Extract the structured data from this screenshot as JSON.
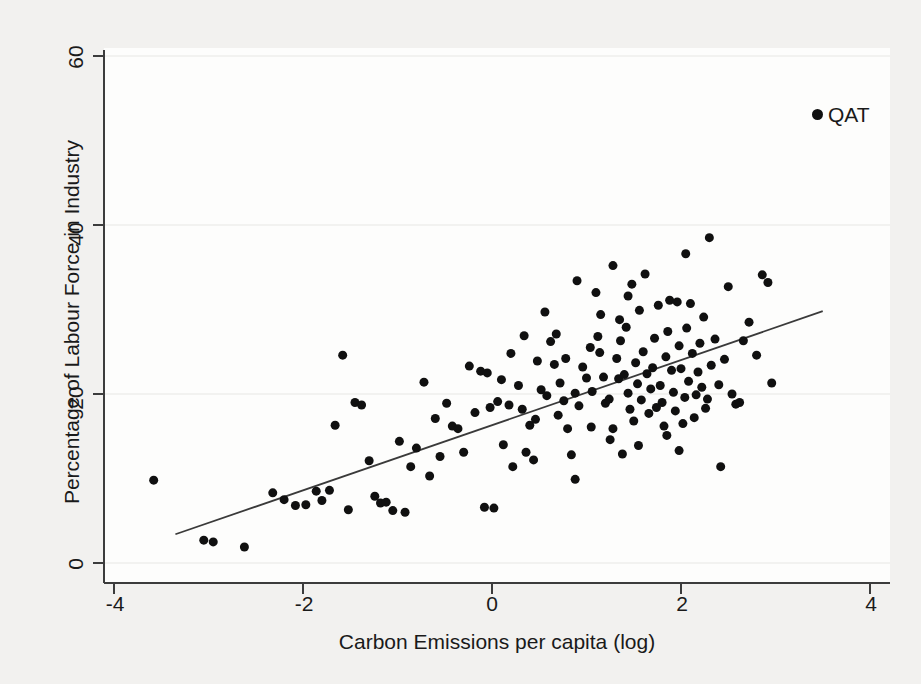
{
  "chart_data": {
    "type": "scatter",
    "title": "",
    "xlabel": "Carbon Emissions per capita (log)",
    "ylabel": "Percentage of Labour Force in Industry",
    "xlim": [
      -4.4,
      4.4
    ],
    "ylim": [
      -1.5,
      62
    ],
    "xticks": [
      -4,
      -2,
      0,
      2,
      4
    ],
    "xticklabels": [
      "-4",
      "-2",
      "0",
      "2",
      "4"
    ],
    "yticks": [
      0,
      20,
      40,
      60
    ],
    "yticklabels": [
      "0",
      "20",
      "40",
      "60"
    ],
    "grid": "faint horizontal gridlines at y ticks",
    "legend": {
      "position": "top-right",
      "entries": [
        {
          "label": "QAT",
          "marker": "filled-circle",
          "color": "#101010"
        }
      ]
    },
    "marker": {
      "shape": "circle",
      "color": "#101010",
      "size": 9
    },
    "series": [
      {
        "name": "countries",
        "points": [
          [
            -3.58,
            9.8
          ],
          [
            -3.05,
            2.7
          ],
          [
            -2.95,
            2.5
          ],
          [
            -2.62,
            1.9
          ],
          [
            -2.32,
            8.3
          ],
          [
            -2.2,
            7.5
          ],
          [
            -2.08,
            6.8
          ],
          [
            -1.97,
            6.9
          ],
          [
            -1.86,
            8.5
          ],
          [
            -1.8,
            7.4
          ],
          [
            -1.72,
            8.6
          ],
          [
            -1.66,
            16.3
          ],
          [
            -1.58,
            24.6
          ],
          [
            -1.52,
            6.3
          ],
          [
            -1.45,
            19.0
          ],
          [
            -1.38,
            18.7
          ],
          [
            -1.3,
            12.1
          ],
          [
            -1.24,
            7.9
          ],
          [
            -1.18,
            7.1
          ],
          [
            -1.12,
            7.2
          ],
          [
            -1.05,
            6.2
          ],
          [
            -0.98,
            14.4
          ],
          [
            -0.92,
            6.0
          ],
          [
            -0.86,
            11.4
          ],
          [
            -0.8,
            13.6
          ],
          [
            -0.72,
            21.4
          ],
          [
            -0.66,
            10.3
          ],
          [
            -0.6,
            17.1
          ],
          [
            -0.55,
            12.6
          ],
          [
            -0.48,
            18.9
          ],
          [
            -0.42,
            16.2
          ],
          [
            -0.36,
            15.9
          ],
          [
            -0.3,
            13.1
          ],
          [
            -0.24,
            23.3
          ],
          [
            -0.18,
            17.8
          ],
          [
            -0.12,
            22.7
          ],
          [
            -0.08,
            6.6
          ],
          [
            -0.02,
            18.4
          ],
          [
            0.02,
            6.5
          ],
          [
            0.06,
            19.1
          ],
          [
            0.12,
            14.0
          ],
          [
            0.18,
            18.7
          ],
          [
            0.22,
            11.4
          ],
          [
            0.28,
            21.0
          ],
          [
            0.32,
            18.2
          ],
          [
            0.36,
            13.1
          ],
          [
            0.4,
            16.3
          ],
          [
            0.44,
            12.2
          ],
          [
            0.48,
            23.9
          ],
          [
            0.52,
            20.5
          ],
          [
            0.56,
            29.7
          ],
          [
            0.58,
            19.8
          ],
          [
            0.62,
            26.2
          ],
          [
            0.66,
            23.5
          ],
          [
            0.7,
            17.5
          ],
          [
            0.72,
            21.3
          ],
          [
            0.76,
            19.2
          ],
          [
            0.8,
            15.9
          ],
          [
            0.84,
            12.8
          ],
          [
            0.88,
            20.1
          ],
          [
            0.92,
            18.6
          ],
          [
            0.96,
            23.2
          ],
          [
            1.0,
            21.9
          ],
          [
            1.04,
            25.5
          ],
          [
            1.06,
            20.3
          ],
          [
            1.1,
            32.0
          ],
          [
            1.14,
            24.9
          ],
          [
            1.18,
            22.0
          ],
          [
            1.2,
            18.9
          ],
          [
            1.24,
            19.4
          ],
          [
            1.28,
            15.9
          ],
          [
            1.32,
            24.2
          ],
          [
            1.34,
            21.8
          ],
          [
            1.36,
            26.3
          ],
          [
            1.4,
            22.3
          ],
          [
            1.42,
            27.9
          ],
          [
            1.44,
            20.1
          ],
          [
            1.46,
            18.2
          ],
          [
            1.5,
            16.8
          ],
          [
            1.52,
            23.7
          ],
          [
            1.54,
            21.2
          ],
          [
            1.56,
            29.9
          ],
          [
            1.58,
            19.3
          ],
          [
            1.6,
            25.0
          ],
          [
            1.62,
            34.2
          ],
          [
            1.64,
            22.4
          ],
          [
            1.66,
            17.7
          ],
          [
            1.68,
            20.6
          ],
          [
            1.7,
            23.1
          ],
          [
            1.72,
            26.6
          ],
          [
            1.74,
            18.4
          ],
          [
            1.76,
            30.5
          ],
          [
            1.78,
            21.0
          ],
          [
            1.8,
            19.0
          ],
          [
            1.82,
            16.2
          ],
          [
            1.84,
            24.4
          ],
          [
            1.86,
            27.4
          ],
          [
            1.88,
            31.1
          ],
          [
            1.9,
            22.8
          ],
          [
            1.92,
            20.2
          ],
          [
            1.94,
            18.0
          ],
          [
            1.96,
            30.9
          ],
          [
            1.98,
            25.7
          ],
          [
            2.0,
            23.0
          ],
          [
            2.02,
            16.5
          ],
          [
            2.04,
            19.6
          ],
          [
            2.06,
            27.8
          ],
          [
            2.08,
            21.5
          ],
          [
            2.1,
            30.7
          ],
          [
            2.12,
            24.8
          ],
          [
            2.14,
            17.2
          ],
          [
            2.16,
            19.9
          ],
          [
            2.18,
            22.6
          ],
          [
            2.2,
            26.0
          ],
          [
            2.22,
            20.8
          ],
          [
            2.26,
            18.3
          ],
          [
            2.3,
            38.5
          ],
          [
            2.32,
            23.4
          ],
          [
            2.36,
            26.5
          ],
          [
            2.4,
            21.1
          ],
          [
            2.42,
            11.4
          ],
          [
            2.46,
            24.1
          ],
          [
            2.5,
            32.7
          ],
          [
            2.54,
            20.0
          ],
          [
            2.58,
            18.8
          ],
          [
            2.62,
            19.0
          ],
          [
            2.66,
            26.3
          ],
          [
            2.72,
            28.5
          ],
          [
            2.8,
            24.6
          ],
          [
            2.86,
            34.1
          ],
          [
            2.92,
            33.2
          ],
          [
            2.96,
            21.3
          ],
          [
            1.28,
            35.2
          ],
          [
            0.9,
            33.4
          ],
          [
            1.48,
            33.0
          ],
          [
            2.05,
            36.6
          ],
          [
            0.34,
            26.9
          ],
          [
            0.2,
            24.8
          ],
          [
            -0.05,
            22.5
          ],
          [
            0.1,
            21.7
          ],
          [
            1.35,
            28.8
          ],
          [
            1.15,
            29.4
          ],
          [
            0.68,
            27.1
          ],
          [
            2.24,
            29.1
          ],
          [
            1.05,
            16.1
          ],
          [
            1.25,
            14.6
          ],
          [
            1.55,
            13.9
          ],
          [
            1.85,
            15.1
          ],
          [
            0.78,
            24.2
          ],
          [
            1.44,
            31.6
          ],
          [
            2.28,
            19.4
          ],
          [
            0.46,
            17.0
          ],
          [
            1.12,
            26.8
          ],
          [
            1.98,
            13.3
          ],
          [
            1.38,
            12.9
          ],
          [
            0.88,
            9.9
          ]
        ]
      }
    ],
    "fit_line": {
      "name": "linear fit",
      "x": [
        -3.35,
        3.5
      ],
      "y": [
        3.4,
        29.8
      ],
      "color": "#3a3a3a"
    }
  },
  "legend": {
    "qat_label": "QAT"
  },
  "axes": {
    "x_title": "Carbon Emissions per capita (log)",
    "y_title": "Percentage of Labour Force in Industry",
    "x_tick_0": "-4",
    "x_tick_1": "-2",
    "x_tick_2": "0",
    "x_tick_3": "2",
    "x_tick_4": "4",
    "y_tick_0": "0",
    "y_tick_1": "20",
    "y_tick_2": "40",
    "y_tick_3": "60"
  }
}
